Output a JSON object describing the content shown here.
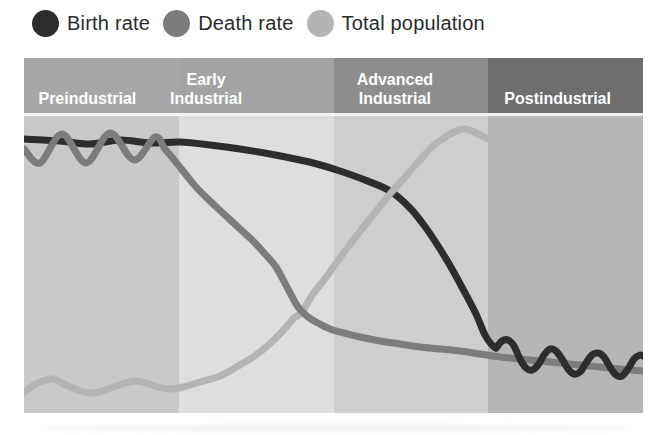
{
  "legend": {
    "items": [
      {
        "label": "Birth rate",
        "color": "#2d2d2d"
      },
      {
        "label": "Death rate",
        "color": "#7c7c7c"
      },
      {
        "label": "Total population",
        "color": "#b4b4b4"
      }
    ]
  },
  "stages": [
    {
      "label": "Preindustrial",
      "header_color": "#a7a7a7",
      "plot_color": "#c9c9c9"
    },
    {
      "label": "Early\nIndustrial",
      "header_color": "#a3a3a3",
      "plot_color": "#dedede"
    },
    {
      "label": "Advanced\nIndustrial",
      "header_color": "#8d8d8d",
      "plot_color": "#cecece"
    },
    {
      "label": "Postindustrial",
      "header_color": "#6e6e6e",
      "plot_color": "#b6b6b6"
    }
  ],
  "chart_data": {
    "type": "line",
    "x_categories": [
      "Preindustrial",
      "Early Industrial",
      "Advanced Industrial",
      "Postindustrial"
    ],
    "axes_visible": false,
    "units": "points are [x,y] in plot-area pixels (619 wide x 297 tall, y increases downward); no numeric axes are shown in the figure",
    "series": [
      {
        "name": "Birth rate",
        "color": "#2d2d2d",
        "segments": [
          {
            "z": 1,
            "stroke_width": 7,
            "points": [
              [
                0,
                23
              ],
              [
                36,
                25
              ],
              [
                66,
                28
              ],
              [
                96,
                24
              ],
              [
                126,
                27
              ],
              [
                156,
                26
              ],
              [
                186,
                29
              ],
              [
                216,
                33
              ],
              [
                246,
                38
              ],
              [
                276,
                44
              ],
              [
                293,
                48
              ],
              [
                316,
                55
              ],
              [
                341,
                64
              ],
              [
                366,
                75
              ],
              [
                386,
                92
              ],
              [
                402,
                112
              ],
              [
                416,
                133
              ],
              [
                428,
                153
              ],
              [
                440,
                175
              ],
              [
                452,
                198
              ],
              [
                461,
                219
              ],
              [
                468,
                229
              ],
              [
                472,
                232
              ]
            ]
          },
          {
            "z": 4,
            "stroke_width": 7,
            "points": [
              [
                472,
                232
              ],
              [
                478,
                225
              ],
              [
                484,
                224
              ],
              [
                490,
                230
              ],
              [
                496,
                243
              ],
              [
                502,
                252
              ],
              [
                508,
                254
              ],
              [
                514,
                249
              ],
              [
                520,
                239
              ],
              [
                526,
                233
              ],
              [
                532,
                235
              ],
              [
                538,
                243
              ],
              [
                544,
                253
              ],
              [
                550,
                258
              ],
              [
                556,
                256
              ],
              [
                562,
                247
              ],
              [
                568,
                239
              ],
              [
                574,
                237
              ],
              [
                580,
                241
              ],
              [
                586,
                251
              ],
              [
                592,
                259
              ],
              [
                598,
                260
              ],
              [
                604,
                253
              ],
              [
                610,
                243
              ],
              [
                616,
                239
              ],
              [
                619,
                240
              ]
            ]
          }
        ]
      },
      {
        "name": "Death rate",
        "color": "#7c7c7c",
        "segments": [
          {
            "z": 3,
            "stroke_width": 7,
            "points": [
              [
                0,
                33
              ],
              [
                16,
                47
              ],
              [
                38,
                18
              ],
              [
                62,
                47
              ],
              [
                86,
                17
              ],
              [
                110,
                44
              ],
              [
                131,
                21
              ],
              [
                141,
                33
              ],
              [
                151,
                45
              ],
              [
                159,
                55
              ],
              [
                172,
                71
              ],
              [
                186,
                85
              ],
              [
                201,
                99
              ],
              [
                216,
                113
              ],
              [
                229,
                125
              ],
              [
                241,
                138
              ],
              [
                252,
                151
              ],
              [
                264,
                173
              ],
              [
                274,
                191
              ],
              [
                284,
                201
              ],
              [
                294,
                207
              ],
              [
                306,
                213
              ],
              [
                320,
                217
              ],
              [
                336,
                221
              ],
              [
                356,
                225
              ],
              [
                376,
                228
              ],
              [
                396,
                231
              ],
              [
                416,
                233
              ],
              [
                436,
                235
              ],
              [
                456,
                238
              ],
              [
                476,
                241
              ],
              [
                496,
                243
              ],
              [
                516,
                245
              ],
              [
                536,
                247
              ],
              [
                556,
                249
              ],
              [
                576,
                251
              ],
              [
                596,
                253
              ],
              [
                619,
                255
              ]
            ]
          }
        ]
      },
      {
        "name": "Total population",
        "color": "#b4b4b4",
        "segments": [
          {
            "z": 2,
            "stroke_width": 7,
            "points": [
              [
                0,
                276
              ],
              [
                14,
                267
              ],
              [
                28,
                263
              ],
              [
                42,
                269
              ],
              [
                56,
                275
              ],
              [
                70,
                277
              ],
              [
                84,
                273
              ],
              [
                98,
                268
              ],
              [
                110,
                265
              ],
              [
                122,
                267
              ],
              [
                134,
                271
              ],
              [
                146,
                273
              ],
              [
                159,
                271
              ],
              [
                176,
                266
              ],
              [
                196,
                260
              ],
              [
                216,
                249
              ],
              [
                236,
                236
              ],
              [
                256,
                218
              ],
              [
                269,
                203
              ],
              [
                278,
                196
              ],
              [
                289,
                178
              ],
              [
                303,
                160
              ],
              [
                321,
                135
              ],
              [
                338,
                113
              ],
              [
                354,
                93
              ],
              [
                366,
                78
              ],
              [
                381,
                61
              ],
              [
                396,
                44
              ],
              [
                408,
                31
              ],
              [
                420,
                22
              ],
              [
                432,
                15
              ],
              [
                440,
                13
              ],
              [
                448,
                15
              ],
              [
                456,
                19
              ],
              [
                466,
                24
              ],
              [
                476,
                29
              ]
            ]
          },
          {
            "z": 5,
            "stroke_width": 2.5,
            "points": [
              [
                476,
                29
              ],
              [
                488,
                34
              ],
              [
                501,
                37
              ],
              [
                516,
                39
              ],
              [
                534,
                37
              ],
              [
                550,
                34
              ],
              [
                566,
                33
              ],
              [
                581,
                35
              ],
              [
                596,
                36
              ],
              [
                611,
                35
              ],
              [
                619,
                35
              ]
            ]
          }
        ]
      }
    ]
  }
}
